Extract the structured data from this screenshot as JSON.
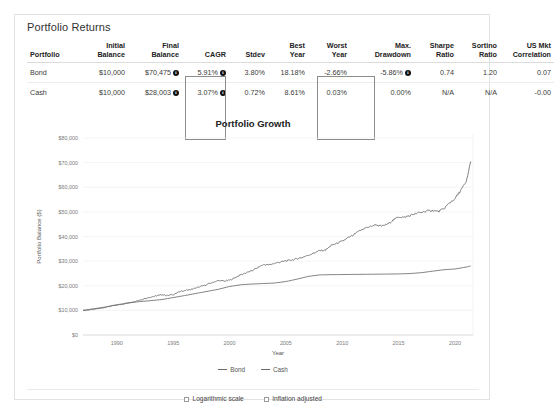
{
  "card": {
    "title": "Portfolio Returns"
  },
  "table": {
    "headers": [
      {
        "line1": "",
        "line2": "Portfolio"
      },
      {
        "line1": "Initial",
        "line2": "Balance"
      },
      {
        "line1": "Final",
        "line2": "Balance"
      },
      {
        "line1": "",
        "line2": "CAGR"
      },
      {
        "line1": "",
        "line2": "Stdev"
      },
      {
        "line1": "Best",
        "line2": "Year"
      },
      {
        "line1": "Worst",
        "line2": "Year"
      },
      {
        "line1": "Max.",
        "line2": "Drawdown"
      },
      {
        "line1": "Sharpe",
        "line2": "Ratio"
      },
      {
        "line1": "Sortino",
        "line2": "Ratio"
      },
      {
        "line1": "US Mkt",
        "line2": "Correlation"
      }
    ],
    "rows": [
      {
        "portfolio": "Bond",
        "initial_balance": "$10,000",
        "final_balance": "$70,475",
        "final_balance_info": true,
        "cagr": "5.91%",
        "cagr_info": true,
        "stdev": "3.80%",
        "best_year": "18.18%",
        "worst_year": "-2.66%",
        "max_drawdown": "-5.86%",
        "max_drawdown_info": true,
        "sharpe_ratio": "0.74",
        "sortino_ratio": "1.20",
        "us_mkt_correlation": "0.07"
      },
      {
        "portfolio": "Cash",
        "initial_balance": "$10,000",
        "final_balance": "$28,003",
        "final_balance_info": true,
        "cagr": "3.07%",
        "cagr_info": true,
        "stdev": "0.72%",
        "best_year": "8.61%",
        "worst_year": "0.03%",
        "max_drawdown": "0.00%",
        "max_drawdown_info": false,
        "sharpe_ratio": "N/A",
        "sortino_ratio": "N/A",
        "us_mkt_correlation": "-0.00"
      }
    ],
    "highlighted_columns": [
      "CAGR",
      "Max. Drawdown"
    ],
    "info_icon_glyph": "i"
  },
  "chart_data": {
    "type": "line",
    "title": "Portfolio Growth",
    "xlabel": "Year",
    "ylabel": "Portfolio Balance ($)",
    "xlim": [
      1987,
      2021.6
    ],
    "ylim": [
      0,
      80000
    ],
    "xticks": [
      1990,
      1995,
      2000,
      2005,
      2010,
      2015,
      2020
    ],
    "xticklabels": [
      "1990",
      "1995",
      "2000",
      "2005",
      "2010",
      "2015",
      "2020"
    ],
    "yticks": [
      0,
      10000,
      20000,
      30000,
      40000,
      50000,
      60000,
      70000,
      80000
    ],
    "yticklabels": [
      "$0",
      "$10,000",
      "$20,000",
      "$30,000",
      "$40,000",
      "$50,000",
      "$60,000",
      "$70,000",
      "$80,000"
    ],
    "grid": true,
    "legend_position": "bottom",
    "colors": {
      "bond": "#6b6b6b",
      "cash": "#6b6b6b"
    },
    "series": [
      {
        "name": "Bond",
        "x": [
          1987.0,
          1987.5,
          1988.0,
          1988.5,
          1989.0,
          1989.5,
          1990.0,
          1990.5,
          1991.0,
          1991.5,
          1992.0,
          1992.5,
          1993.0,
          1993.5,
          1994.0,
          1994.5,
          1995.0,
          1995.5,
          1996.0,
          1996.5,
          1997.0,
          1997.5,
          1998.0,
          1998.5,
          1999.0,
          1999.5,
          2000.0,
          2000.5,
          2001.0,
          2001.5,
          2002.0,
          2002.5,
          2003.0,
          2003.5,
          2004.0,
          2004.5,
          2005.0,
          2005.5,
          2006.0,
          2006.5,
          2007.0,
          2007.5,
          2008.0,
          2008.5,
          2009.0,
          2009.5,
          2010.0,
          2010.5,
          2011.0,
          2011.5,
          2012.0,
          2012.5,
          2013.0,
          2013.5,
          2014.0,
          2014.5,
          2015.0,
          2015.5,
          2016.0,
          2016.5,
          2017.0,
          2017.5,
          2018.0,
          2018.5,
          2019.0,
          2019.5,
          2020.0,
          2020.5,
          2021.0,
          2021.4
        ],
        "y": [
          10000,
          10200,
          10450,
          10850,
          11200,
          11750,
          12150,
          12500,
          13050,
          13600,
          14150,
          14800,
          15400,
          15900,
          16350,
          16050,
          16450,
          17400,
          18150,
          18400,
          19000,
          19800,
          20500,
          21400,
          22100,
          21900,
          22200,
          23300,
          24500,
          25300,
          26100,
          27400,
          28600,
          28500,
          29100,
          29600,
          30100,
          30400,
          31000,
          31600,
          32400,
          33300,
          34300,
          34400,
          36300,
          37200,
          38100,
          39400,
          40600,
          42200,
          43400,
          44100,
          44700,
          44200,
          44900,
          46600,
          48000,
          47800,
          48500,
          49300,
          49800,
          50300,
          50600,
          50100,
          51200,
          53600,
          55400,
          58600,
          62200,
          70475
        ],
        "final_value": 70475
      },
      {
        "name": "Cash",
        "x": [
          1987.0,
          1988.0,
          1989.0,
          1990.0,
          1991.0,
          1992.0,
          1993.0,
          1994.0,
          1995.0,
          1996.0,
          1997.0,
          1998.0,
          1999.0,
          2000.0,
          2001.0,
          2002.0,
          2003.0,
          2004.0,
          2005.0,
          2006.0,
          2007.0,
          2008.0,
          2009.0,
          2010.0,
          2011.0,
          2012.0,
          2013.0,
          2014.0,
          2015.0,
          2016.0,
          2017.0,
          2018.0,
          2019.0,
          2020.0,
          2021.0,
          2021.4
        ],
        "y": [
          10000,
          10650,
          11400,
          12250,
          13000,
          13550,
          13950,
          14400,
          15200,
          16000,
          16850,
          17700,
          18550,
          19700,
          20400,
          20700,
          20900,
          21100,
          21700,
          22700,
          23800,
          24400,
          24500,
          24550,
          24600,
          24650,
          24700,
          24750,
          24800,
          24950,
          25300,
          25900,
          26500,
          26800,
          27600,
          28003
        ],
        "final_value": 28003
      }
    ],
    "legend": [
      "Bond",
      "Cash"
    ]
  },
  "options": [
    {
      "label": "Logarithmic scale",
      "checked": false
    },
    {
      "label": "Inflation adjusted",
      "checked": false
    }
  ]
}
